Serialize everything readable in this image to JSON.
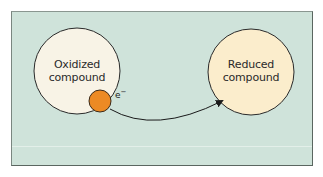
{
  "diagram": {
    "nodes": [
      {
        "id": "oxidized",
        "line1": "Oxidized",
        "line2": "compound",
        "fill": "#f8f3e6"
      },
      {
        "id": "reduced",
        "line1": "Reduced",
        "line2": "compound",
        "fill": "#fbedcc"
      }
    ],
    "electron": {
      "label": "e",
      "charge": "−",
      "fill": "#ec8a24"
    },
    "edge": {
      "from": "oxidized",
      "to": "reduced",
      "label": "electron transfer"
    },
    "background": "#cfe3da"
  }
}
